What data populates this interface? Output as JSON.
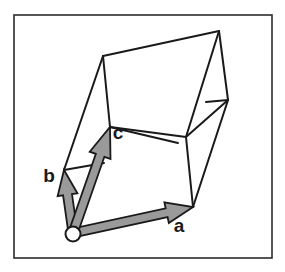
{
  "figure": {
    "background_color": "#ffffff",
    "border": {
      "name": "figure-frame",
      "x": 14,
      "y": 15,
      "width": 258,
      "height": 243,
      "stroke_color": "#2b2b2b",
      "stroke_width": 1.6,
      "fill": "#ffffff"
    },
    "wireframe": {
      "stroke_color": "#1a1a1a",
      "stroke_width": 2.0,
      "fill": "none",
      "vertices": {
        "origin": [
          73,
          233
        ],
        "a_tip": [
          193,
          207
        ],
        "b_tip": [
          64,
          170
        ],
        "c_tip": [
          110,
          127
        ],
        "top_back_left": [
          103,
          56
        ],
        "top_back_right": [
          219,
          31
        ],
        "right_mid": [
          228,
          100
        ],
        "front_mid": [
          186,
          137
        ],
        "ab_far": [
          184,
          144
        ]
      },
      "edges": [
        {
          "name": "edge-origin-to-a",
          "from": [
            73,
            233
          ],
          "to": [
            193,
            207
          ]
        },
        {
          "name": "edge-origin-to-b",
          "from": [
            73,
            233
          ],
          "to": [
            64,
            170
          ]
        },
        {
          "name": "edge-origin-to-c",
          "from": [
            73,
            233
          ],
          "to": [
            110,
            127
          ]
        },
        {
          "name": "edge-b-to-top-back-left",
          "from": [
            64,
            170
          ],
          "to": [
            103,
            56
          ]
        },
        {
          "name": "edge-c-to-top-back-left",
          "from": [
            110,
            127
          ],
          "to": [
            103,
            56
          ]
        },
        {
          "name": "edge-top-back-left-to-top-back-right",
          "from": [
            103,
            56
          ],
          "to": [
            219,
            31
          ]
        },
        {
          "name": "edge-top-back-right-to-right-mid",
          "from": [
            219,
            31
          ],
          "to": [
            228,
            100
          ]
        },
        {
          "name": "edge-c-to-front-mid",
          "from": [
            110,
            127
          ],
          "to": [
            186,
            137
          ]
        },
        {
          "name": "edge-front-mid-to-top-back-right",
          "from": [
            186,
            137
          ],
          "to": [
            219,
            31
          ]
        },
        {
          "name": "edge-front-mid-to-right-mid",
          "from": [
            186,
            137
          ],
          "to": [
            228,
            100
          ]
        },
        {
          "name": "edge-front-mid-to-a",
          "from": [
            186,
            137
          ],
          "to": [
            193,
            207
          ]
        },
        {
          "name": "edge-a-to-right-mid",
          "from": [
            193,
            207
          ],
          "to": [
            228,
            100
          ]
        },
        {
          "name": "edge-partial-from-b",
          "from": [
            64,
            170
          ],
          "to": [
            104,
            163
          ]
        },
        {
          "name": "edge-partial-from-c",
          "from": [
            110,
            127
          ],
          "to": [
            178,
            143
          ]
        },
        {
          "name": "edge-partial-back-diagonal",
          "from": [
            206,
            102
          ],
          "to": [
            228,
            100
          ]
        }
      ]
    },
    "vectors": [
      {
        "name": "vector-a",
        "label": "a",
        "from": [
          73,
          233
        ],
        "to": [
          193,
          207
        ],
        "label_pos": [
          179,
          232
        ],
        "shaft_width": 9,
        "head_length": 27,
        "head_width": 21,
        "fill_color": "#9a9a9a",
        "stroke_color": "#1a1a1a"
      },
      {
        "name": "vector-b",
        "label": "b",
        "from": [
          73,
          233
        ],
        "to": [
          64,
          170
        ],
        "label_pos": [
          49,
          182
        ],
        "shaft_width": 9,
        "head_length": 25,
        "head_width": 20,
        "fill_color": "#9a9a9a",
        "stroke_color": "#1a1a1a"
      },
      {
        "name": "vector-c",
        "label": "c",
        "from": [
          73,
          233
        ],
        "to": [
          110,
          127
        ],
        "label_pos": [
          118,
          139
        ],
        "shaft_width": 9,
        "head_length": 30,
        "head_width": 22,
        "fill_color": "#9a9a9a",
        "stroke_color": "#1a1a1a"
      }
    ],
    "origin_marker": {
      "name": "origin-circle",
      "cx": 73,
      "cy": 234,
      "r": 7.5,
      "fill": "#ffffff",
      "stroke_color": "#1a1a1a",
      "stroke_width": 2.0
    }
  }
}
